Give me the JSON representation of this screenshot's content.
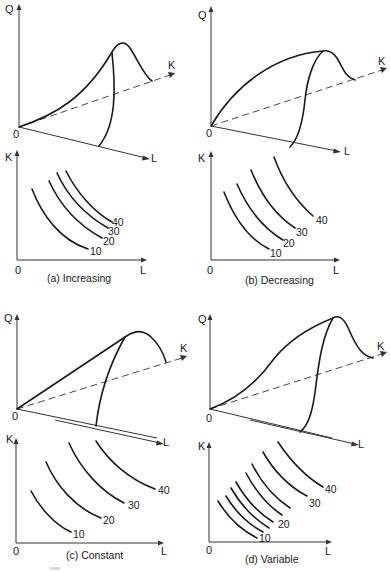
{
  "figure": {
    "axis_labels": {
      "q": "Q",
      "k": "K",
      "l": "L",
      "origin": "0"
    },
    "panels": [
      {
        "id": "a",
        "caption": "(a)  Increasing",
        "returns_to_scale": "Increasing",
        "surface_shape": "convex rising cross-section along K, peak then fall",
        "isoquants": [
          "10",
          "20",
          "30",
          "40"
        ],
        "isoquant_spacing": "decreasing (curves get closer together)"
      },
      {
        "id": "b",
        "caption": "(b)  Decreasing",
        "returns_to_scale": "Decreasing",
        "surface_shape": "concave rising cross-section along K, flat top then fall",
        "isoquants": [
          "10",
          "20",
          "30",
          "40"
        ],
        "isoquant_spacing": "increasing (curves get farther apart)"
      },
      {
        "id": "c",
        "caption": "(c) Constant",
        "returns_to_scale": "Constant",
        "surface_shape": "straight-line rising cross-section along K, rounded peak then fall",
        "isoquants": [
          "10",
          "20",
          "30",
          "40"
        ],
        "isoquant_spacing": "equal spacing"
      },
      {
        "id": "d",
        "caption": "(d) Variable",
        "returns_to_scale": "Variable",
        "surface_shape": "S-shaped rising cross-section along K, peak then fall",
        "isoquants": [
          "10",
          "20",
          "30",
          "40"
        ],
        "isoquant_spacing": "closely packed low curves, wider spacing at higher output",
        "unlabeled_isoquant_count": 4
      }
    ]
  }
}
